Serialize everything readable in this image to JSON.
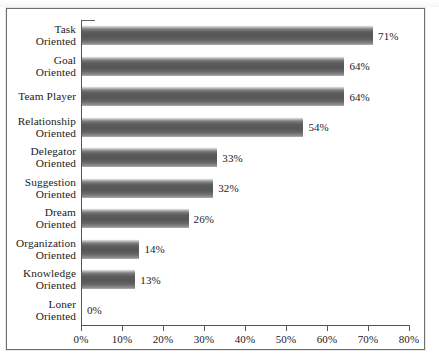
{
  "chart_data": {
    "type": "bar",
    "orientation": "horizontal",
    "title": "",
    "xlabel": "",
    "ylabel": "",
    "xlim": [
      0,
      80
    ],
    "grid": false,
    "legend": null,
    "xticks": [
      "0%",
      "10%",
      "20%",
      "30%",
      "40%",
      "50%",
      "60%",
      "70%",
      "80%"
    ],
    "xtick_values": [
      0,
      10,
      20,
      30,
      40,
      50,
      60,
      70,
      80
    ],
    "categories": [
      "Task\nOriented",
      "Goal\nOriented",
      "Team Player",
      "Relationship\nOriented",
      "Delegator\nOriented",
      "Suggestion\nOriented",
      "Dream\nOriented",
      "Organization\nOriented",
      "Knowledge\nOriented",
      "Loner\nOriented"
    ],
    "values": [
      71,
      64,
      64,
      54,
      33,
      32,
      26,
      14,
      13,
      0
    ],
    "value_labels": [
      "71%",
      "64%",
      "64%",
      "54%",
      "33%",
      "32%",
      "26%",
      "14%",
      "13%",
      "0%"
    ]
  },
  "style": {
    "bar_color_dark": "#565656",
    "bar_color_light": "#f4f4f4",
    "axis_color": "#555555",
    "text_color": "#1b1b1b",
    "frame_color": "#6f6f6f",
    "background": "#ffffff"
  }
}
